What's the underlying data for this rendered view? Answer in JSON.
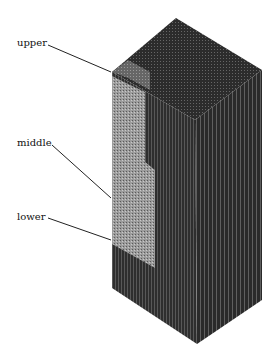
{
  "figure": {
    "type": "3D block diagram (stratified rectangular prism)",
    "labels": [
      {
        "id": "upper",
        "text": "upper"
      },
      {
        "id": "middle",
        "text": "middle"
      },
      {
        "id": "lower",
        "text": "lower"
      }
    ],
    "colors": {
      "background": "#ffffff",
      "top_face": "#2b2b2b",
      "right_face": "#262626",
      "left_face_dark": "#303030",
      "upper_region": "#6b6b6b",
      "middle_region": "#9a9a9a",
      "leader_line": "#222222"
    }
  }
}
